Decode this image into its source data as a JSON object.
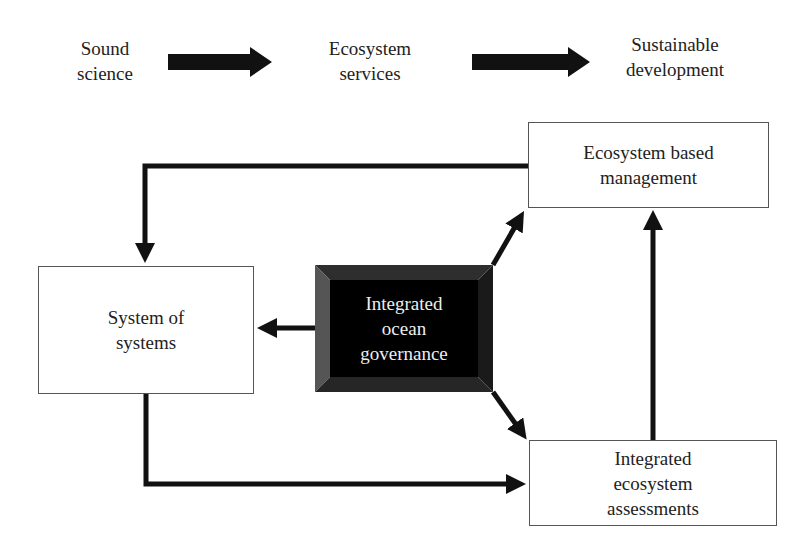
{
  "top_flow": {
    "step1": {
      "line1": "Sound",
      "line2": "science"
    },
    "step2": {
      "line1": "Ecosystem",
      "line2": "services"
    },
    "step3": {
      "line1": "Sustainable",
      "line2": "development"
    }
  },
  "boxes": {
    "ecosystem_based_management": {
      "line1": "Ecosystem based",
      "line2": "management"
    },
    "system_of_systems": {
      "line1": "System of",
      "line2": "systems"
    },
    "integrated_ocean_governance": {
      "line1": "Integrated",
      "line2": "ocean",
      "line3": "governance"
    },
    "integrated_ecosystem_assessments": {
      "line1": "Integrated",
      "line2": "ecosystem",
      "line3": "assessments"
    }
  },
  "colors": {
    "arrow": "#111111",
    "box_border": "#555555",
    "governance_fill": "#000000",
    "governance_bevel": "#3a3a3a"
  }
}
